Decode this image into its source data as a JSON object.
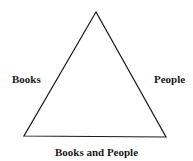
{
  "diagram": {
    "shape": "triangle",
    "stroke_color": "#1a1a1a",
    "vertices": {
      "apex": [
        96,
        12
      ],
      "bottom_left": [
        24,
        136
      ],
      "bottom_right": [
        166,
        137
      ]
    },
    "labels": {
      "left_side": "Books",
      "right_side": "People",
      "bottom_side": "Books and People"
    }
  }
}
